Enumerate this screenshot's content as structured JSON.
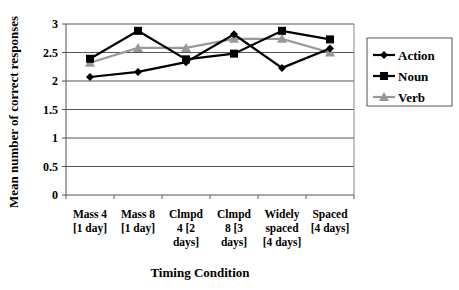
{
  "chart_data": {
    "type": "line",
    "title": "",
    "xlabel": "Timing Condition",
    "ylabel": "Mean number of correct responses",
    "ylim": [
      0,
      3
    ],
    "yticks": [
      0,
      0.5,
      1,
      1.5,
      2,
      2.5,
      3
    ],
    "ytick_labels": [
      "0",
      "0.5",
      "1",
      "1.5",
      "2",
      "2.5",
      "3"
    ],
    "grid": true,
    "legend_position": "right",
    "categories": [
      "Mass 4 [1 day]",
      "Mass 8 [1 day]",
      "Clmpd 4 [2 days]",
      "Clmpd 8 [3 days]",
      "Widely spaced [4 days]",
      "Spaced [4 days]"
    ],
    "category_lines": [
      [
        "Mass 4",
        "[1 day]"
      ],
      [
        "Mass 8",
        "[1 day]"
      ],
      [
        "Clmpd",
        "4 [2",
        "days]"
      ],
      [
        "Clmpd",
        "8 [3",
        "days]"
      ],
      [
        "Widely",
        "spaced",
        "[4 days]"
      ],
      [
        "Spaced",
        "[4 days]"
      ]
    ],
    "series": [
      {
        "name": "Action",
        "marker": "diamond",
        "color": "#000000",
        "values": [
          2.07,
          2.16,
          2.33,
          2.82,
          2.23,
          2.57
        ]
      },
      {
        "name": "Noun",
        "marker": "square",
        "color": "#000000",
        "values": [
          2.39,
          2.88,
          2.38,
          2.48,
          2.88,
          2.73
        ]
      },
      {
        "name": "Verb",
        "marker": "triangle",
        "color": "#999999",
        "values": [
          2.32,
          2.58,
          2.58,
          2.74,
          2.74,
          2.5
        ]
      }
    ]
  }
}
